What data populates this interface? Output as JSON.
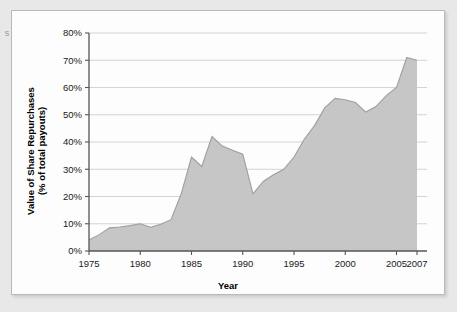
{
  "figure": {
    "background_color": "#e8e8e8",
    "panel_color": "#fdfdfd",
    "border_color": "#b9b9b9",
    "scan_artifact_text": "s"
  },
  "chart_data": {
    "type": "area",
    "title": "",
    "xlabel": "Year",
    "ylabel": "Value of Share Repurchases\n(% of total payouts)",
    "ylabel_line1": "Value of Share Repurchases",
    "ylabel_line2": "(% of total payouts)",
    "xlim": [
      1975,
      2007
    ],
    "ylim": [
      0,
      80
    ],
    "ytick_values": [
      0,
      10,
      20,
      30,
      40,
      50,
      60,
      70,
      80
    ],
    "ytick_labels": [
      "0%",
      "10%",
      "20%",
      "30%",
      "40%",
      "50%",
      "60%",
      "70%",
      "80%"
    ],
    "xtick_values": [
      1975,
      1980,
      1985,
      1990,
      1995,
      2000,
      2005,
      2007
    ],
    "xtick_labels": [
      "1975",
      "1980",
      "1985",
      "1990",
      "1995",
      "2000",
      "2005",
      "2007"
    ],
    "grid": "horizontal",
    "legend": "none",
    "series_color": "#c6c6c6",
    "line_color": "#9e9e9e",
    "x": [
      1975,
      1976,
      1977,
      1978,
      1979,
      1980,
      1981,
      1982,
      1983,
      1984,
      1985,
      1986,
      1987,
      1988,
      1989,
      1990,
      1991,
      1992,
      1993,
      1994,
      1995,
      1996,
      1997,
      1998,
      1999,
      2000,
      2001,
      2002,
      2003,
      2004,
      2005,
      2006,
      2007
    ],
    "values": [
      4.0,
      6.0,
      8.5,
      8.8,
      9.3,
      10.0,
      8.7,
      9.8,
      11.5,
      21.0,
      34.5,
      31.0,
      42.0,
      38.5,
      37.0,
      35.5,
      21.0,
      25.5,
      28.0,
      30.0,
      34.5,
      41.0,
      46.0,
      52.5,
      56.0,
      55.5,
      54.5,
      51.0,
      53.0,
      57.0,
      60.0,
      71.0,
      70.0
    ]
  }
}
